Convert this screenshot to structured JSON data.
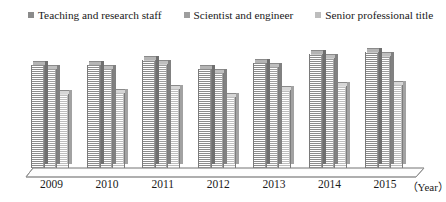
{
  "legend": {
    "items": [
      {
        "label": "Teaching and research staff",
        "color": "#8b8b8b",
        "icon": "square-marker-icon"
      },
      {
        "label": "Scientist and engineer",
        "color": "#9e9e9e",
        "icon": "square-marker-icon"
      },
      {
        "label": "Senior professional title",
        "color": "#bdbdbd",
        "icon": "square-marker-icon"
      }
    ]
  },
  "axis": {
    "x_title": "（Year）",
    "tick_labels": [
      "2009",
      "2010",
      "2011",
      "2012",
      "2013",
      "2014",
      "2015"
    ]
  },
  "chart_data": {
    "type": "bar",
    "title": "",
    "subtitle": "",
    "xlabel": "（Year）",
    "ylabel": "",
    "grid": false,
    "legend_position": "top",
    "style": "3d-clustered-column",
    "categories": [
      "2009",
      "2010",
      "2011",
      "2012",
      "2013",
      "2014",
      "2015"
    ],
    "ylim": [
      0,
      100
    ],
    "axis_ticks_visible": false,
    "series": [
      {
        "name": "Teaching and research staff",
        "color": "#8b8b8b",
        "values": [
          79,
          79,
          83,
          76,
          81,
          88,
          89
        ]
      },
      {
        "name": "Scientist and engineer",
        "color": "#9e9e9e",
        "values": [
          76,
          76,
          80,
          73,
          78,
          85,
          86
        ]
      },
      {
        "name": "Senior professional title",
        "color": "#bdbdbd",
        "values": [
          57,
          58,
          61,
          55,
          60,
          63,
          64
        ]
      }
    ]
  }
}
